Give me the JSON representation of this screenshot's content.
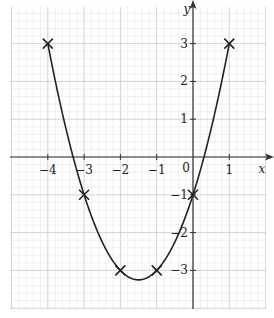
{
  "chart_data": {
    "type": "line",
    "title": "",
    "xlabel": "x",
    "ylabel": "y",
    "function": "y = x^2 + 3x - 1",
    "xlim": [
      -4.9,
      2.0
    ],
    "ylim": [
      -4.1,
      4.1
    ],
    "grid": true,
    "minor_grid_step": 0.2,
    "x_ticks": [
      -4,
      -3,
      -2,
      -1,
      0,
      1
    ],
    "y_ticks": [
      -3,
      -2,
      -1,
      1,
      2,
      3
    ],
    "x_tick_labels": [
      "−4",
      "−3",
      "−2",
      "−1",
      "0",
      "1"
    ],
    "y_tick_labels": [
      "−3",
      "−2",
      "−1",
      "1",
      "2",
      "3"
    ],
    "origin_label": "0",
    "points": [
      {
        "x": -4,
        "y": 3
      },
      {
        "x": -3,
        "y": -1
      },
      {
        "x": -2,
        "y": -3
      },
      {
        "x": -1,
        "y": -3
      },
      {
        "x": 0,
        "y": -1
      },
      {
        "x": 1,
        "y": 3
      }
    ],
    "curve_x_range": [
      -4,
      1
    ],
    "marker": "cross",
    "colors": {
      "curve": "#222222",
      "axis": "#333333",
      "grid_major": "#c8c8c8",
      "grid_minor": "#e6e6e6"
    }
  }
}
